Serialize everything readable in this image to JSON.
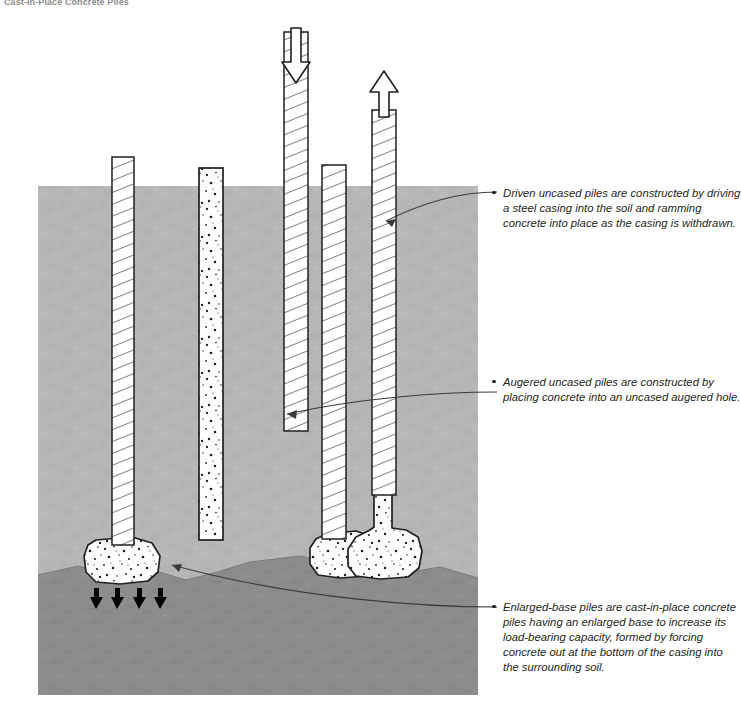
{
  "figure": {
    "title": "Cast-in-Place Concrete Piles"
  },
  "annotations": [
    {
      "id": "driven-uncased-piles",
      "text": "Driven uncased piles are constructed by driving a steel casing into the soil and ramming concrete into place as the casing is withdrawn."
    },
    {
      "id": "augered-uncased-piles",
      "text": "Augered uncased piles are constructed by placing concrete into an uncased augered hole."
    },
    {
      "id": "enlarged-base-piles",
      "text": "Enlarged-base piles are cast-in-place concrete piles having an enlarged base to increase its load-bearing capacity, formed by forcing concrete out at the bottom of the casing into the surrounding soil."
    }
  ],
  "colors": {
    "upper_soil": "#b6b6b6",
    "lower_soil": "#8c8c8c",
    "outline": "#231f20",
    "concrete_fill": "#fdfdfd",
    "page_background": "#ffffff"
  },
  "diagram": {
    "ground_surface_label": "ground surface",
    "soil_strata": [
      {
        "name": "upper-soil-stratum"
      },
      {
        "name": "lower-soil-stratum"
      }
    ],
    "piles": [
      {
        "id": "pile-enlarged-base-left",
        "texture": "hatched-casing",
        "has_enlarged_base": true
      },
      {
        "id": "pile-augered-uncased",
        "texture": "stippled-concrete",
        "has_enlarged_base": false
      },
      {
        "id": "pile-driven-casing",
        "texture": "hatched-casing",
        "has_enlarged_base": false
      },
      {
        "id": "pile-enlarged-base-middle",
        "texture": "hatched-casing",
        "has_enlarged_base": true
      },
      {
        "id": "pile-casing-withdrawn",
        "texture": "hatched-casing-over-concrete",
        "has_enlarged_base": true
      }
    ],
    "arrows": [
      {
        "id": "driving-force-arrow",
        "direction": "down"
      },
      {
        "id": "casing-withdrawal-arrow",
        "direction": "up"
      },
      {
        "id": "bearing-reaction-arrow-1",
        "direction": "up"
      },
      {
        "id": "bearing-reaction-arrow-2",
        "direction": "up"
      },
      {
        "id": "bearing-reaction-arrow-3",
        "direction": "up"
      },
      {
        "id": "bearing-reaction-arrow-4",
        "direction": "up"
      }
    ]
  }
}
